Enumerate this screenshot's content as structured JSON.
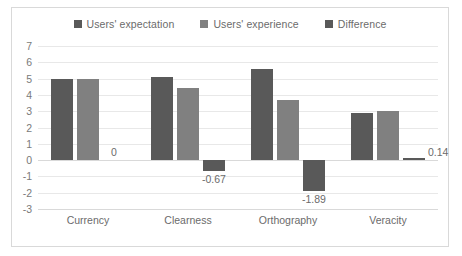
{
  "chart_data": {
    "type": "bar",
    "title": "",
    "subtitle": "",
    "xlabel": "",
    "ylabel": "",
    "categories": [
      "Currency",
      "Clearness",
      "Orthography",
      "Veracity"
    ],
    "series": [
      {
        "name": "Users' expectation",
        "color": "#595959",
        "values": [
          5.0,
          5.1,
          5.6,
          2.9
        ]
      },
      {
        "name": "Users' experience",
        "color": "#808080",
        "values": [
          5.0,
          4.43,
          3.71,
          3.04
        ]
      },
      {
        "name": "Difference",
        "color": "#595959",
        "values": [
          0,
          -0.67,
          -1.89,
          0.14
        ],
        "data_labels": [
          "0",
          "-0.67",
          "-1.89",
          "0.14"
        ]
      }
    ],
    "ylim": [
      -3,
      7
    ],
    "ytick_step": 1,
    "yticks": [
      "7",
      "6",
      "5",
      "4",
      "3",
      "2",
      "1",
      "0",
      "-1",
      "-2",
      "-3"
    ],
    "grid": true,
    "legend_position": "top"
  },
  "legend": {
    "items": [
      {
        "label": "Users' expectation",
        "color": "#595959",
        "icon": "legend-swatch-square"
      },
      {
        "label": "Users' experience",
        "color": "#808080",
        "icon": "legend-swatch-square"
      },
      {
        "label": "Difference",
        "color": "#595959",
        "icon": "legend-swatch-square"
      }
    ]
  }
}
